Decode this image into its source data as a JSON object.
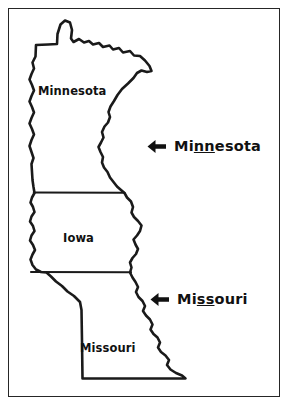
{
  "page": {
    "background_color": "#ffffff",
    "frame_color": "#262626",
    "ink_color": "#1a1a1a"
  },
  "map": {
    "name": "three-state-outline-map",
    "states": [
      {
        "id": "minnesota",
        "label": "Minnesota"
      },
      {
        "id": "iowa",
        "label": "Iowa"
      },
      {
        "id": "missouri",
        "label": "Missouri"
      }
    ]
  },
  "annotations": [
    {
      "id": "minnesota",
      "icon": "left-arrow-icon",
      "prefix": "Mi",
      "underlined": "nn",
      "suffix": "esota",
      "full_text": "Minnesota"
    },
    {
      "id": "missouri",
      "icon": "left-arrow-icon",
      "prefix": "Mi",
      "underlined": "ss",
      "suffix": "ouri",
      "full_text": "Missouri"
    }
  ]
}
